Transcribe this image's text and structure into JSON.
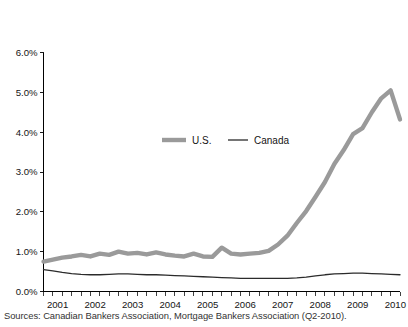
{
  "figure": {
    "title": "",
    "source_note": "Sources: Canadian Bankers Association, Mortgage Bankers Association (Q2-2010)."
  },
  "legend": {
    "us_label": "U.S.",
    "canada_label": "Canada"
  },
  "colors": {
    "us": "#9a9a9a",
    "canada": "#2b2b2b",
    "axis": "#000000",
    "text": "#141414",
    "background": "#ffffff"
  },
  "chart_data": {
    "type": "line",
    "title": "",
    "xlabel": "",
    "ylabel": "",
    "ylim": [
      0.0,
      6.0
    ],
    "xlim": [
      2001.0,
      2010.5
    ],
    "grid": false,
    "legend_position": "inside-center",
    "ytick_labels": [
      "0.0%",
      "1.0%",
      "2.0%",
      "3.0%",
      "4.0%",
      "5.0%",
      "6.0%"
    ],
    "ytick_values": [
      0.0,
      1.0,
      2.0,
      3.0,
      4.0,
      5.0,
      6.0
    ],
    "xtick_labels": [
      "2001",
      "2002",
      "2003",
      "2004",
      "2005",
      "2006",
      "2007",
      "2008",
      "2009",
      "2010"
    ],
    "xtick_values": [
      2001,
      2002,
      2003,
      2004,
      2005,
      2006,
      2007,
      2008,
      2009,
      2010
    ],
    "x_minor_interval": 0.25,
    "x": [
      2001.0,
      2001.25,
      2001.5,
      2001.75,
      2002.0,
      2002.25,
      2002.5,
      2002.75,
      2003.0,
      2003.25,
      2003.5,
      2003.75,
      2004.0,
      2004.25,
      2004.5,
      2004.75,
      2005.0,
      2005.25,
      2005.5,
      2005.75,
      2006.0,
      2006.25,
      2006.5,
      2006.75,
      2007.0,
      2007.25,
      2007.5,
      2007.75,
      2008.0,
      2008.25,
      2008.5,
      2008.75,
      2009.0,
      2009.25,
      2009.5,
      2009.75,
      2010.0,
      2010.25,
      2010.5
    ],
    "series": [
      {
        "name": "U.S.",
        "color": "#9a9a9a",
        "line_width": 4.4,
        "values": [
          0.75,
          0.8,
          0.85,
          0.88,
          0.92,
          0.88,
          0.95,
          0.92,
          1.0,
          0.95,
          0.97,
          0.93,
          0.98,
          0.93,
          0.9,
          0.88,
          0.95,
          0.88,
          0.87,
          1.1,
          0.95,
          0.93,
          0.95,
          0.97,
          1.02,
          1.18,
          1.4,
          1.72,
          2.02,
          2.38,
          2.75,
          3.2,
          3.55,
          3.95,
          4.1,
          4.5,
          4.85,
          5.05,
          4.32
        ]
      },
      {
        "name": "Canada",
        "color": "#2b2b2b",
        "line_width": 1.3,
        "values": [
          0.55,
          0.52,
          0.48,
          0.45,
          0.43,
          0.42,
          0.42,
          0.43,
          0.44,
          0.44,
          0.43,
          0.42,
          0.42,
          0.41,
          0.4,
          0.39,
          0.38,
          0.37,
          0.36,
          0.35,
          0.34,
          0.33,
          0.33,
          0.33,
          0.33,
          0.33,
          0.33,
          0.34,
          0.36,
          0.39,
          0.42,
          0.44,
          0.45,
          0.46,
          0.46,
          0.45,
          0.44,
          0.43,
          0.42
        ]
      }
    ]
  }
}
